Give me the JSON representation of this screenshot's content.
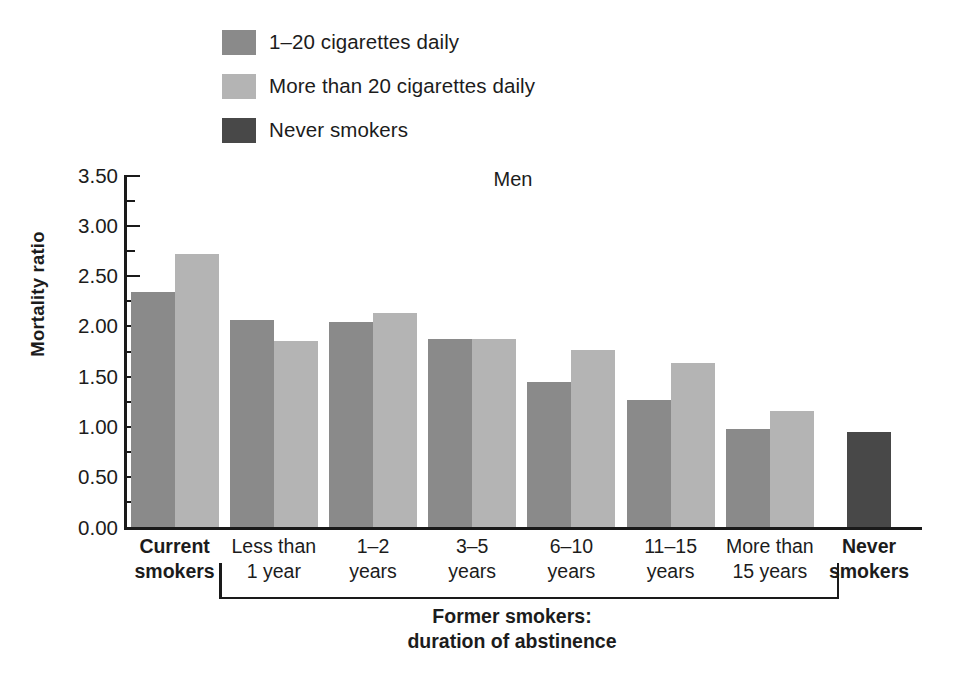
{
  "chart_data": {
    "type": "bar",
    "title": "Men",
    "xlabel": "Former smokers: duration of abstinence",
    "ylabel": "Mortality ratio",
    "ylim": [
      0.0,
      3.5
    ],
    "ytick_labels": [
      "0.00",
      "0.50",
      "1.00",
      "1.50",
      "2.00",
      "2.50",
      "3.00",
      "3.50"
    ],
    "ytick_values": [
      0.0,
      0.5,
      1.0,
      1.5,
      2.0,
      2.5,
      3.0,
      3.5
    ],
    "minor_tick_interval": 0.25,
    "grid": false,
    "legend_position": "top-left",
    "categories": [
      "Current smokers",
      "Less than 1 year",
      "1–2 years",
      "3–5 years",
      "6–10 years",
      "11–15 years",
      "More than 15 years",
      "Never smokers"
    ],
    "series": [
      {
        "name": "1–20 cigarettes daily",
        "color": "#8a8a8a",
        "values": [
          2.34,
          2.06,
          2.04,
          1.87,
          1.45,
          1.27,
          0.98,
          null
        ]
      },
      {
        "name": "More than 20 cigarettes daily",
        "color": "#b4b4b4",
        "values": [
          2.72,
          1.85,
          2.13,
          1.87,
          1.76,
          1.64,
          1.16,
          null
        ]
      },
      {
        "name": "Never smokers",
        "color": "#484848",
        "values": [
          null,
          null,
          null,
          null,
          null,
          null,
          null,
          0.95
        ]
      }
    ],
    "annotations": [
      "Former smokers: duration of abstinence bracket spans the six abstinence-duration categories"
    ]
  },
  "legend": {
    "items": [
      {
        "label": "1–20 cigarettes daily",
        "color": "#8a8a8a",
        "swatch_name": "legend-swatch-1-20-cigarettes"
      },
      {
        "label": "More than 20 cigarettes daily",
        "color": "#b4b4b4",
        "swatch_name": "legend-swatch-more-than-20-cigarettes"
      },
      {
        "label": "Never smokers",
        "color": "#484848",
        "swatch_name": "legend-swatch-never-smokers"
      }
    ]
  },
  "axis": {
    "title": "Men",
    "y_label": "Mortality ratio"
  },
  "x_categories": [
    {
      "lines": [
        "Current",
        "smokers"
      ],
      "bold": true
    },
    {
      "lines": [
        "Less than",
        "1 year"
      ],
      "bold": false
    },
    {
      "lines": [
        "1–2",
        "years"
      ],
      "bold": false
    },
    {
      "lines": [
        "3–5",
        "years"
      ],
      "bold": false
    },
    {
      "lines": [
        "6–10",
        "years"
      ],
      "bold": false
    },
    {
      "lines": [
        "11–15",
        "years"
      ],
      "bold": false
    },
    {
      "lines": [
        "More than",
        "15 years"
      ],
      "bold": false
    },
    {
      "lines": [
        "Never",
        "smokers"
      ],
      "bold": true
    }
  ],
  "bracket_caption": {
    "line1": "Former smokers:",
    "line2": "duration of abstinence"
  }
}
